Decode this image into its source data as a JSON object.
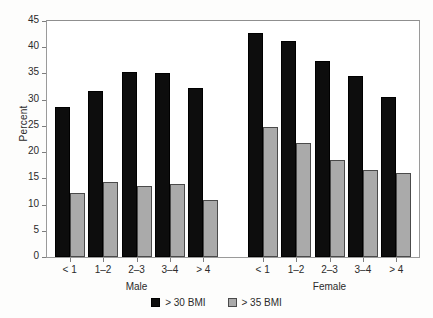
{
  "chart_data": {
    "type": "bar",
    "title": "",
    "xlabel": "",
    "ylabel": "Percent",
    "ylim": [
      0,
      45
    ],
    "yticks": [
      0,
      5,
      10,
      15,
      20,
      25,
      30,
      35,
      40,
      45
    ],
    "grid": false,
    "legend_position": "bottom-center",
    "categories": [
      "< 1",
      "1–2",
      "2–3",
      "3–4",
      "> 4"
    ],
    "groups": [
      {
        "name": "Male",
        "series": [
          {
            "name": "> 30 BMI",
            "values": [
              28.7,
              31.6,
              35.3,
              35.1,
              32.3
            ]
          },
          {
            "name": "> 35 BMI",
            "values": [
              12.3,
              14.3,
              13.6,
              13.9,
              10.8
            ]
          }
        ]
      },
      {
        "name": "Female",
        "series": [
          {
            "name": "> 30 BMI",
            "values": [
              42.7,
              41.1,
              37.3,
              34.6,
              30.6
            ]
          },
          {
            "name": "> 35 BMI",
            "values": [
              24.7,
              21.8,
              18.5,
              16.6,
              16.0
            ]
          }
        ]
      }
    ],
    "legend": [
      {
        "label": "> 30 BMI",
        "color": "#0d0d0d"
      },
      {
        "label": "> 35 BMI",
        "color": "#aaaaaa"
      }
    ],
    "colors": {
      "series_1": "#0d0d0d",
      "series_2": "#aaaaaa",
      "axis": "#7d7d7d",
      "frame": "#9a9a9a",
      "background": "#ffffff",
      "text": "#2b2b2b"
    }
  }
}
